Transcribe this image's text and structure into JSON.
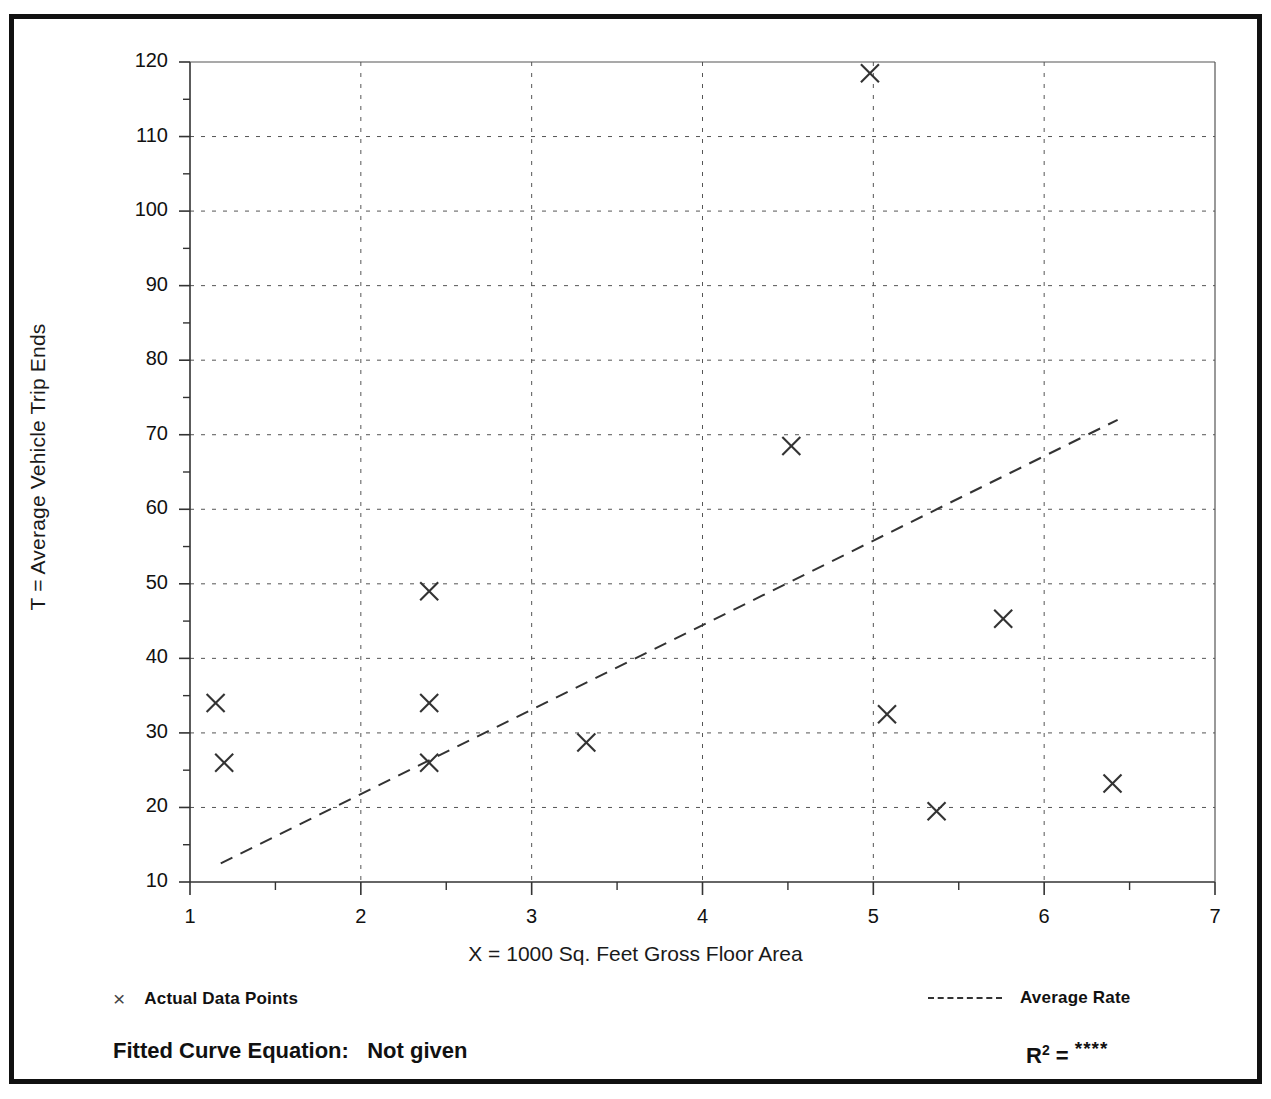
{
  "figure": {
    "clipped_top_title": "",
    "ylabel": "T = Average Vehicle Trip Ends",
    "xlabel": "X = 1000 Sq. Feet Gross Floor Area"
  },
  "legend": {
    "data_marker_glyph": "×",
    "data_points_label": "Actual Data Points",
    "average_rate_label": "Average Rate"
  },
  "equation": {
    "fitted_label": "Fitted Curve Equation:",
    "fitted_value": "Not given",
    "r2_label": "R",
    "r2_exponent": "2",
    "r2_equals": "=",
    "r2_value": "****"
  },
  "chart_data": {
    "type": "scatter",
    "title": "",
    "xlabel": "X = 1000 Sq. Feet Gross Floor Area",
    "ylabel": "T = Average Vehicle Trip Ends",
    "xlim": [
      1,
      7
    ],
    "ylim": [
      10,
      120
    ],
    "xticks": [
      1,
      2,
      3,
      4,
      5,
      6,
      7
    ],
    "yticks": [
      10,
      20,
      30,
      40,
      50,
      60,
      70,
      80,
      90,
      100,
      110,
      120
    ],
    "x_minor_step": 0.5,
    "y_minor_step": 5,
    "grid": true,
    "grid_style": "dotted",
    "legend_position": "below-axes",
    "series": [
      {
        "name": "Actual Data Points",
        "type": "scatter",
        "marker": "x",
        "color": "#333333",
        "points": [
          {
            "x": 1.15,
            "y": 34.0
          },
          {
            "x": 1.2,
            "y": 26.0
          },
          {
            "x": 2.4,
            "y": 49.0
          },
          {
            "x": 2.4,
            "y": 34.0
          },
          {
            "x": 2.4,
            "y": 26.0
          },
          {
            "x": 3.32,
            "y": 28.7
          },
          {
            "x": 4.52,
            "y": 68.5
          },
          {
            "x": 4.98,
            "y": 118.5
          },
          {
            "x": 5.08,
            "y": 32.5
          },
          {
            "x": 5.37,
            "y": 19.5
          },
          {
            "x": 5.76,
            "y": 45.3
          },
          {
            "x": 6.4,
            "y": 23.2
          }
        ]
      },
      {
        "name": "Average Rate",
        "type": "line",
        "style": "dashed",
        "color": "#333333",
        "endpoints": [
          {
            "x": 1.18,
            "y": 12.5
          },
          {
            "x": 6.43,
            "y": 72.0
          }
        ]
      }
    ]
  }
}
